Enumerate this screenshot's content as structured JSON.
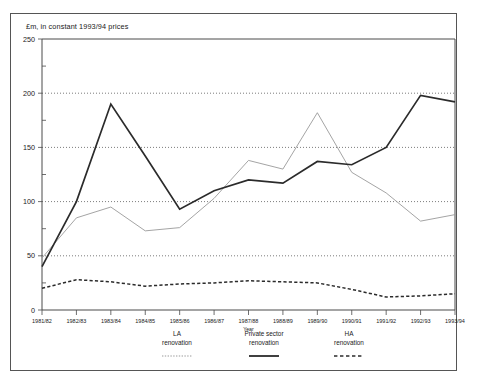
{
  "figure": {
    "axis_title": "£m, in constant 1993/94 prices",
    "xaxis_name": "Year"
  },
  "legend": {
    "entries": [
      {
        "line1": "LA",
        "line2": "renovation",
        "style": "dotted"
      },
      {
        "line1": "Private sector",
        "line2": "renovation",
        "style": "solid"
      },
      {
        "line1": "HA",
        "line2": "renovation",
        "style": "dashed"
      }
    ]
  },
  "chart_data": {
    "type": "line",
    "title": "£m, in constant 1993/94 prices",
    "xlabel": "Year",
    "ylabel": "£m, in constant 1993/94 prices",
    "ylim": [
      0,
      250
    ],
    "yticks": [
      0,
      50,
      100,
      150,
      200,
      250
    ],
    "yminor_ticks": [
      25,
      75,
      125,
      175,
      225
    ],
    "grid": "horizontal-dotted",
    "legend_position": "below-plot",
    "categories": [
      "1981/82",
      "1982/83",
      "1983/84",
      "1984/85",
      "1985/86",
      "1986/87",
      "1987/88",
      "1988/89",
      "1989/90",
      "1990/91",
      "1991/92",
      "1992/93",
      "1993/94"
    ],
    "series": [
      {
        "name": "LA renovation",
        "style": "dotted",
        "color": "#9a9a9a",
        "values": [
          48,
          85,
          95,
          73,
          76,
          103,
          138,
          130,
          182,
          127,
          108,
          82,
          88
        ]
      },
      {
        "name": "Private sector renovation",
        "style": "solid",
        "color": "#2b2b2b",
        "values": [
          40,
          100,
          190,
          142,
          93,
          110,
          120,
          117,
          137,
          134,
          150,
          198,
          192
        ]
      },
      {
        "name": "HA renovation",
        "style": "dashed",
        "color": "#2b2b2b",
        "values": [
          20,
          28,
          26,
          22,
          24,
          25,
          27,
          26,
          25,
          19,
          12,
          13,
          15
        ]
      }
    ]
  },
  "colors": {
    "frame": "#4a4a4a",
    "grid": "#5a5a5a",
    "solid_series": "#2b2b2b",
    "light_series": "#9a9a9a",
    "background": "#ffffff"
  }
}
